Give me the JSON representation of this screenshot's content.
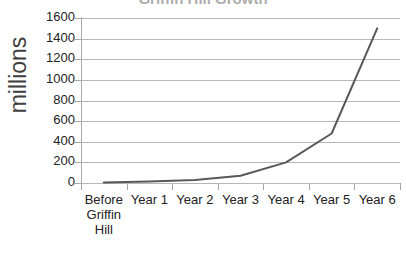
{
  "chart": {
    "title_fragment": "Griffin Hill Growth",
    "y_axis_title": "millions"
  },
  "chart_data": {
    "type": "line",
    "title": "",
    "xlabel": "",
    "ylabel": "millions",
    "categories": [
      "Before Griffin Hill",
      "Year 1",
      "Year 2",
      "Year 3",
      "Year 4",
      "Year 5",
      "Year 6"
    ],
    "category_labels_wrapped": [
      "Before\nGriffin\nHill",
      "Year 1",
      "Year 2",
      "Year 3",
      "Year 4",
      "Year 5",
      "Year 6"
    ],
    "values": [
      5,
      15,
      30,
      70,
      200,
      480,
      1500
    ],
    "ylim": [
      0,
      1600
    ],
    "yticks": [
      0,
      200,
      400,
      600,
      800,
      1000,
      1200,
      1400,
      1600
    ],
    "ytick_labels": [
      "0",
      "200",
      "400",
      "600",
      "800",
      "1000",
      "1200",
      "1400",
      "1600"
    ],
    "grid": true,
    "grid_axis": "y",
    "legend": false,
    "legend_position": "none",
    "series": [
      {
        "name": "millions",
        "values": [
          5,
          15,
          30,
          70,
          200,
          480,
          1500
        ],
        "color": "#595959",
        "line_width": 2,
        "markers": false
      }
    ],
    "colors": {
      "line": "#595959",
      "gridline": "#b7b7b7",
      "axis": "#a6a6a6",
      "text": "#222222",
      "background": "#ffffff"
    }
  }
}
